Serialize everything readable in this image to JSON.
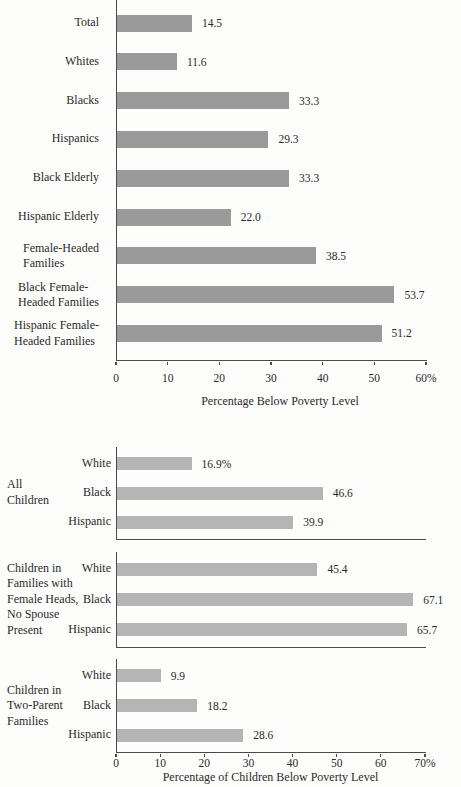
{
  "figure": {
    "description_top": "poverty rates by group",
    "description_bottom": "child poverty rates by race and family type"
  },
  "colors": {
    "bar_dark": "#9a9a9a",
    "bar_light": "#b5b5b5",
    "axis": "#4a4a4a",
    "text": "#2a2a2a",
    "background": "#fdfdfb"
  },
  "chart_data": [
    {
      "type": "bar",
      "orientation": "horizontal",
      "title": "",
      "categories": [
        "Total",
        "Whites",
        "Blacks",
        "Hispanics",
        "Black Elderly",
        "Hispanic Elderly",
        "Female-Headed\nFamilies",
        "Black Female-\nHeaded Families",
        "Hispanic Female-\nHeaded Families"
      ],
      "values": [
        14.5,
        11.6,
        33.3,
        29.3,
        33.3,
        22.0,
        38.5,
        53.7,
        51.2
      ],
      "value_labels": [
        "14.5",
        "11.6",
        "33.3",
        "29.3",
        "33.3",
        "22.0",
        "38.5",
        "53.7",
        "51.2"
      ],
      "xlabel": "Percentage Below Poverty Level",
      "ylabel": "",
      "xlim": [
        0,
        60
      ],
      "xticks": [
        0,
        10,
        20,
        30,
        40,
        50,
        60
      ],
      "xtick_labels": [
        "0",
        "10",
        "20",
        "30",
        "40",
        "50",
        "60%"
      ],
      "grid": false,
      "legend": false,
      "bar_color": "#9a9a9a"
    },
    {
      "type": "bar",
      "orientation": "horizontal",
      "title": "",
      "grouped": true,
      "groups": [
        {
          "label": "All\nChildren",
          "categories": [
            "White",
            "Black",
            "Hispanic"
          ],
          "values": [
            16.9,
            46.6,
            39.9
          ],
          "value_labels": [
            "16.9%",
            "46.6",
            "39.9"
          ]
        },
        {
          "label": "Children in\nFamilies with\nFemale Heads,\nNo Spouse\nPresent",
          "categories": [
            "White",
            "Black",
            "Hispanic"
          ],
          "values": [
            45.4,
            67.1,
            65.7
          ],
          "value_labels": [
            "45.4",
            "67.1",
            "65.7"
          ]
        },
        {
          "label": "Children in\nTwo-Parent\nFamilies",
          "categories": [
            "White",
            "Black",
            "Hispanic"
          ],
          "values": [
            9.9,
            18.2,
            28.6
          ],
          "value_labels": [
            "9.9",
            "18.2",
            "28.6"
          ]
        }
      ],
      "xlabel": "Percentage of Children Below Poverty Level",
      "ylabel": "",
      "xlim": [
        0,
        70
      ],
      "xticks": [
        0,
        10,
        20,
        30,
        40,
        50,
        60,
        70
      ],
      "xtick_labels": [
        "0",
        "10",
        "20",
        "30",
        "40",
        "50",
        "60",
        "70%"
      ],
      "grid": false,
      "legend": false,
      "bar_color": "#b5b5b5"
    }
  ]
}
